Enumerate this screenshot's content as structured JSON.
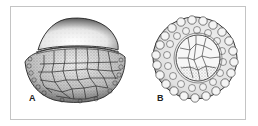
{
  "figure": {
    "panels": [
      {
        "id": "A",
        "label": "A",
        "description": "Dome-shaped cell with stippled cap and polygonal cells below"
      },
      {
        "id": "B",
        "label": "B",
        "description": "Circular cluster of polygonal cells with outer ring"
      }
    ],
    "colors": {
      "frame": "#c4c4c4",
      "ink": "#222222",
      "stipple": "#555555",
      "background": "#ffffff"
    }
  }
}
